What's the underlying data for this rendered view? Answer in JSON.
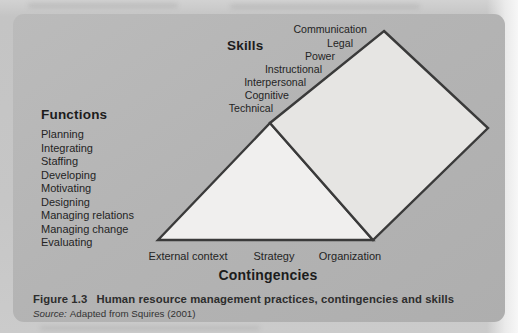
{
  "figure": {
    "skills": {
      "heading": "Skills",
      "items": [
        "Communication",
        "Legal",
        "Power",
        "Instructional",
        "Interpersonal",
        "Cognitive",
        "Technical"
      ]
    },
    "functions": {
      "heading": "Functions",
      "items": [
        "Planning",
        "Integrating",
        "Staffing",
        "Developing",
        "Motivating",
        "Designing",
        "Managing relations",
        "Managing change",
        "Evaluating"
      ]
    },
    "contingencies": {
      "heading": "Contingencies",
      "items": [
        "External context",
        "Strategy",
        "Organization"
      ]
    },
    "caption": {
      "label": "Figure 1.3",
      "title": "Human resource management practices, contingencies and skills"
    },
    "source": {
      "label": "Source:",
      "text": "Adapted from Squires (2001)"
    },
    "colors": {
      "page_bg": "#c6c6c6",
      "card_bg": "#b4b4b4",
      "triangle_fill": "#f0efee",
      "diamond_fill": "#e6e5e3",
      "shape_stroke": "#3a3a3a",
      "text": "#1f1f1f"
    }
  }
}
